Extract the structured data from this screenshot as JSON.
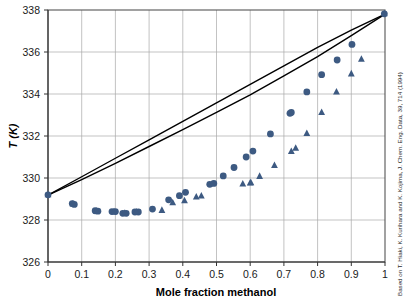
{
  "chart_data": {
    "type": "scatter",
    "title": "",
    "xlabel": "Mole fraction methanol",
    "ylabel": "T (K)",
    "xlim": [
      0,
      1
    ],
    "ylim": [
      326,
      338
    ],
    "xticks": [
      "0",
      "0.1",
      "0.2",
      "0.3",
      "0.4",
      "0.5",
      "0.6",
      "0.7",
      "0.8",
      "0.9",
      "1"
    ],
    "xtick_values": [
      0,
      0.1,
      0.2,
      0.3,
      0.4,
      0.5,
      0.6,
      0.7,
      0.8,
      0.9,
      1
    ],
    "yticks": [
      "326",
      "328",
      "330",
      "332",
      "334",
      "336",
      "338"
    ],
    "ytick_values": [
      326,
      328,
      330,
      332,
      334,
      336,
      338
    ],
    "grid": true,
    "legend": "none",
    "marker_color": "#3d5a82",
    "line_color": "#000000",
    "annotation": "Based on T. Hiaki, K. Kurihara and K. Kojima, J. Chem. Eng. Data, 39, 714 (1994)",
    "series": [
      {
        "name": "Experimental vapour composition (circles)",
        "marker": "circle",
        "points": [
          [
            0.0,
            329.2
          ],
          [
            0.072,
            328.78
          ],
          [
            0.078,
            328.74
          ],
          [
            0.14,
            328.44
          ],
          [
            0.148,
            328.42
          ],
          [
            0.19,
            328.4
          ],
          [
            0.2,
            328.4
          ],
          [
            0.222,
            328.32
          ],
          [
            0.232,
            328.32
          ],
          [
            0.258,
            328.38
          ],
          [
            0.268,
            328.38
          ],
          [
            0.31,
            328.52
          ],
          [
            0.358,
            328.96
          ],
          [
            0.39,
            329.16
          ],
          [
            0.408,
            329.32
          ],
          [
            0.48,
            329.7
          ],
          [
            0.492,
            329.74
          ],
          [
            0.52,
            330.1
          ],
          [
            0.552,
            330.5
          ],
          [
            0.588,
            331.0
          ],
          [
            0.608,
            331.28
          ],
          [
            0.66,
            332.1
          ],
          [
            0.718,
            333.08
          ],
          [
            0.722,
            333.12
          ],
          [
            0.768,
            334.1
          ],
          [
            0.812,
            334.92
          ],
          [
            0.858,
            335.62
          ],
          [
            0.902,
            336.36
          ],
          [
            0.998,
            337.82
          ]
        ]
      },
      {
        "name": "Experimental liquid composition (triangles)",
        "marker": "triangle",
        "points": [
          [
            0.0,
            329.2
          ],
          [
            0.074,
            328.76
          ],
          [
            0.144,
            328.42
          ],
          [
            0.196,
            328.4
          ],
          [
            0.228,
            328.32
          ],
          [
            0.262,
            328.38
          ],
          [
            0.338,
            328.46
          ],
          [
            0.37,
            328.82
          ],
          [
            0.405,
            328.92
          ],
          [
            0.44,
            329.1
          ],
          [
            0.455,
            329.14
          ],
          [
            0.578,
            329.72
          ],
          [
            0.6,
            329.76
          ],
          [
            0.602,
            329.78
          ],
          [
            0.628,
            330.08
          ],
          [
            0.672,
            330.6
          ],
          [
            0.722,
            331.26
          ],
          [
            0.735,
            331.42
          ],
          [
            0.768,
            332.12
          ],
          [
            0.812,
            333.12
          ],
          [
            0.856,
            334.1
          ],
          [
            0.9,
            334.96
          ],
          [
            0.93,
            335.66
          ],
          [
            0.998,
            337.82
          ]
        ]
      }
    ],
    "curves": [
      {
        "name": "Calculated bubble-point curve (upper)",
        "points": [
          [
            0.0,
            329.18
          ],
          [
            0.1,
            330.06
          ],
          [
            0.2,
            330.94
          ],
          [
            0.3,
            331.82
          ],
          [
            0.4,
            332.7
          ],
          [
            0.5,
            333.58
          ],
          [
            0.6,
            334.46
          ],
          [
            0.7,
            335.34
          ],
          [
            0.8,
            336.22
          ],
          [
            0.9,
            337.04
          ],
          [
            1.0,
            337.8
          ]
        ]
      },
      {
        "name": "Calculated dew-point curve (lower)",
        "points": [
          [
            0.0,
            329.18
          ],
          [
            0.1,
            329.92
          ],
          [
            0.2,
            330.7
          ],
          [
            0.3,
            331.5
          ],
          [
            0.4,
            332.3
          ],
          [
            0.5,
            333.12
          ],
          [
            0.6,
            333.96
          ],
          [
            0.7,
            334.86
          ],
          [
            0.8,
            335.78
          ],
          [
            0.9,
            336.78
          ],
          [
            1.0,
            337.8
          ]
        ]
      }
    ]
  }
}
